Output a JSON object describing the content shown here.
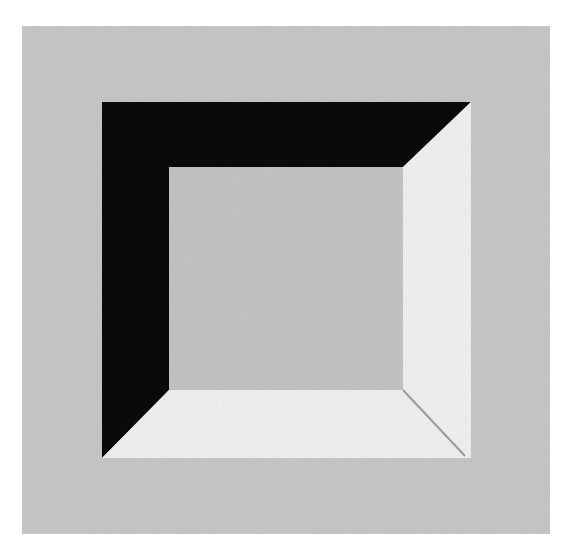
{
  "artwork": {
    "kind": "abstract painting",
    "description": "Grey square canvas with a beveled square frame: black bevel on top and left edges, white bevel on right and bottom edges, grey inner square",
    "colors": {
      "canvas": "#c8c8c8",
      "inner": "#c4c4c4",
      "dark_bevel": "#0a0a0a",
      "light_bevel": "#f1f1ef",
      "page": "#ffffff",
      "crease": "#9a9a9a"
    },
    "geometry": {
      "outer_square": {
        "left": 102,
        "top": 102,
        "right": 471,
        "bottom": 458
      },
      "inner_square": {
        "left": 169,
        "top": 167,
        "right": 403,
        "bottom": 390
      }
    }
  }
}
